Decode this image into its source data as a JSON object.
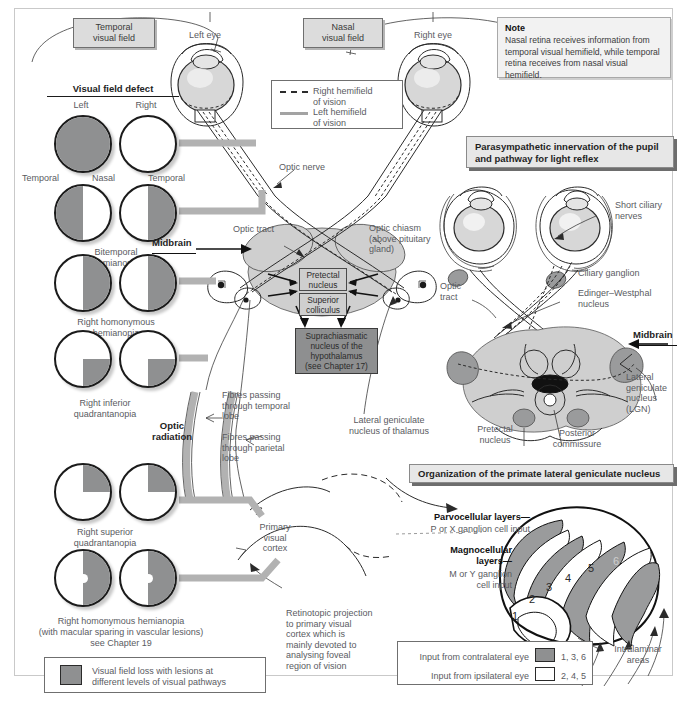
{
  "figure": {
    "colors": {
      "defect_fill": "#8f9091",
      "band_grey": "#b2b2b2",
      "box_grey": "#dcdcdc",
      "node_dark": "#8e8f90",
      "outline": "#1b1b1b"
    }
  },
  "top_labels": {
    "temporal_visual_field": "Temporal\nvisual field",
    "nasal_visual_field": "Nasal\nvisual field",
    "left_eye": "Left eye",
    "right_eye": "Right eye"
  },
  "note": {
    "heading": "Note",
    "body": "Nasal retina receives information from temporal visual hemifield, while temporal retina receives from nasal visual hemifield."
  },
  "hemifield_key": {
    "right_label": "Right hemifield\nof vision",
    "left_label": "Left hemifield\nof vision",
    "right_style": "dashed",
    "left_style": "solid"
  },
  "visual_field_defect": {
    "title": "Visual field defect",
    "col_left": "Left",
    "col_right": "Right",
    "axis_labels": [
      "Temporal",
      "Nasal",
      "Temporal"
    ],
    "rows": [
      {
        "name": "",
        "left_fill": "all",
        "right_fill": "none",
        "macula": false
      },
      {
        "name": "Bitemporal\nhemianopia",
        "left_fill": "left",
        "right_fill": "right",
        "macula": false
      },
      {
        "name": "Right homonymous\nhemianopia",
        "left_fill": "right",
        "right_fill": "right",
        "macula": false
      },
      {
        "name": "Right inferior\nquadrantanopia",
        "left_fill": "lower-right",
        "right_fill": "lower-right",
        "macula": false
      },
      {
        "name": "Right superior\nquadrantanopia",
        "left_fill": "upper-right",
        "right_fill": "upper-right",
        "macula": false
      },
      {
        "name": "Right homonymous hemianopia\n(with macular sparing in vascular lesions)\nsee Chapter 19",
        "left_fill": "right",
        "right_fill": "right",
        "macula": true
      }
    ]
  },
  "pathway_labels": {
    "optic_nerve": "Optic nerve",
    "optic_tract": "Optic tract",
    "optic_chiasm": "Optic chiasm\n(above pituitary\ngland)",
    "midbrain": "Midbrain",
    "pretectal_nucleus": "Pretectal\nnucleus",
    "superior_colliculus": "Superior\ncolliculus",
    "suprachiasmatic": "Suprachiasmatic\nnucleus of the\nhypothalamus\n(see Chapter 17)",
    "lgn_thalamus": "Lateral geniculate\nnucleus of thalamus",
    "fibres_temporal": "Fibres passing\nthrough temporal\nlobe",
    "fibres_parietal": "Fibres passing\nthrough parietal\nlobe",
    "optic_radiation": "Optic\nradiation",
    "primary_visual_cortex": "Primary\nvisual\ncortex",
    "retinotopic": "Retinotopic projection\nto primary visual\ncortex which is\nmainly devoted to\nanalysing foveal\nregion of vision"
  },
  "legend_defect": {
    "text": "Visual field loss with lesions at\ndifferent levels of visual pathways"
  },
  "parasympathetic": {
    "banner": "Parasympathetic innervation of the pupil\nand pathway for light reflex",
    "labels": {
      "short_ciliary_nerves": "Short ciliary\nnerves",
      "ciliary_ganglion": "Ciliary ganglion",
      "edinger_westphal": "Edinger–Westphal\nnucleus",
      "optic_tract": "Optic\ntract",
      "midbrain": "Midbrain",
      "lgn": "Lateral\ngeniculate\nnucleus\n(LGN)",
      "pretectal_nucleus": "Pretectal\nnucleus",
      "posterior_commissure": "Posterior\ncommissure"
    }
  },
  "lgn_panel": {
    "banner": "Organization of the primate lateral geniculate nucleus",
    "parvocellular": "Parvocellular layers—",
    "parvocellular_sub": "P or X ganglion cell input",
    "magnocellular": "Magnocellular\nlayers—",
    "magnocellular_sub": "M or Y ganglion\ncell input",
    "layer_numbers": [
      "1",
      "2",
      "3",
      "4",
      "5",
      "6"
    ],
    "intralaminar": "Intralaminar\nareas",
    "key": [
      {
        "label": "Input from contralateral eye",
        "swatch": "filled",
        "layers": "1, 3, 6"
      },
      {
        "label": "Input from ipsilateral eye",
        "swatch": "white",
        "layers": "2, 4, 5"
      }
    ]
  }
}
